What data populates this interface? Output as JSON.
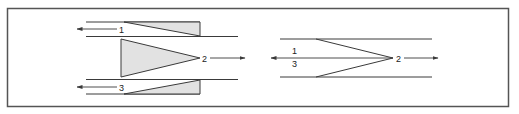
{
  "figure": {
    "left_diagram": {
      "name": "separated-flows",
      "labels": {
        "upper": "1",
        "middle": "2",
        "lower": "3"
      },
      "flow_directions": {
        "upper": "left",
        "middle": "right",
        "lower": "left"
      }
    },
    "right_diagram": {
      "name": "merged-flows",
      "labels": {
        "upper": "1",
        "lower": "3",
        "apex": "2"
      },
      "flow_directions": {
        "combined_1_3": "left",
        "apex_2": "right"
      }
    },
    "colors": {
      "fill": "#e2e2e2",
      "stroke": "#3a3a3a",
      "frame": "#555555"
    }
  }
}
